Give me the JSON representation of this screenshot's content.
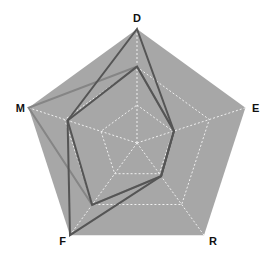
{
  "chart_data": {
    "type": "radar",
    "title": "",
    "axes": [
      "D",
      "E",
      "R",
      "F",
      "M"
    ],
    "levels": 3,
    "range": [
      0,
      1
    ],
    "grid": true,
    "legend": null,
    "series": [
      {
        "name": "series-1",
        "values": [
          1.0,
          0.34,
          0.36,
          1.0,
          0.64
        ],
        "color": "#555555"
      },
      {
        "name": "series-2",
        "values": [
          0.67,
          0.34,
          0.36,
          0.67,
          0.64
        ],
        "color": "#555555"
      },
      {
        "name": "series-3",
        "values": [
          0.67,
          0.34,
          0.36,
          0.67,
          1.0
        ],
        "color": "#858585"
      }
    ]
  },
  "style": {
    "background_fill": "#a7a7a7",
    "grid_color": "#f0f0f0",
    "label_color": "#111111"
  }
}
